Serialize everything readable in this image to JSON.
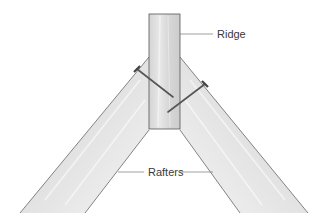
{
  "diagram": {
    "type": "roof framing detail",
    "labels": {
      "ridge": "Ridge",
      "rafters": "Rafters"
    },
    "parts": [
      {
        "id": "ridge-board",
        "label": "Ridge"
      },
      {
        "id": "left-rafter",
        "label": "Rafters"
      },
      {
        "id": "right-rafter",
        "label": "Rafters"
      },
      {
        "id": "left-nail"
      },
      {
        "id": "right-nail"
      }
    ],
    "colors": {
      "wood_fill": "#d9d9d9",
      "wood_light": "#eeeeee",
      "outline": "#555555",
      "nail": "#6a6a6a",
      "leader": "#777777",
      "text": "#3a3a3a"
    }
  }
}
